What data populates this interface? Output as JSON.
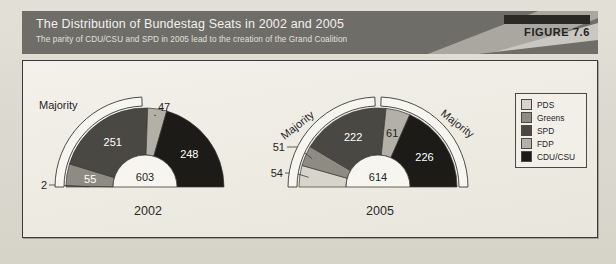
{
  "figure": {
    "title": "The Distribution of Bundestag Seats in 2002 and 2005",
    "subtitle": "The parity of CDU/CSU and SPD in 2005 lead to the creation of the Grand Coalition",
    "badge": "FIGURE 7.6"
  },
  "legend": {
    "position": "right",
    "items": [
      {
        "label": "PDS",
        "color": "#d7d4cb"
      },
      {
        "label": "Greens",
        "color": "#8e8b83"
      },
      {
        "label": "SPD",
        "color": "#4a4843"
      },
      {
        "label": "FDP",
        "color": "#b3b0a7"
      },
      {
        "label": "CDU/CSU",
        "color": "#1c1b18"
      }
    ]
  },
  "charts": [
    {
      "year": "2002",
      "total": "603",
      "majority_labels": [
        "Majority"
      ],
      "slices": [
        {
          "party": "PDS",
          "value": 2,
          "label": "2",
          "color": "#d7d4cb",
          "callout": true
        },
        {
          "party": "Greens",
          "value": 55,
          "label": "55",
          "color": "#8e8b83",
          "callout": false
        },
        {
          "party": "SPD",
          "value": 251,
          "label": "251",
          "color": "#4a4843",
          "callout": false
        },
        {
          "party": "FDP",
          "value": 47,
          "label": "47",
          "color": "#b3b0a7",
          "callout": true
        },
        {
          "party": "CDU/CSU",
          "value": 248,
          "label": "248",
          "color": "#1c1b18",
          "callout": false
        }
      ]
    },
    {
      "year": "2005",
      "total": "614",
      "majority_labels": [
        "Majority",
        "Majority"
      ],
      "slices": [
        {
          "party": "PDS",
          "value": 54,
          "label": "54",
          "color": "#d7d4cb",
          "callout": true
        },
        {
          "party": "Greens",
          "value": 51,
          "label": "51",
          "color": "#8e8b83",
          "callout": true
        },
        {
          "party": "SPD",
          "value": 222,
          "label": "222",
          "color": "#4a4843",
          "callout": false
        },
        {
          "party": "FDP",
          "value": 61,
          "label": "61",
          "color": "#b3b0a7",
          "callout": false
        },
        {
          "party": "CDU/CSU",
          "value": 226,
          "label": "226",
          "color": "#1c1b18",
          "callout": false
        }
      ]
    }
  ],
  "chart_data": {
    "type": "pie",
    "title": "The Distribution of Bundestag Seats in 2002 and 2005",
    "subtitle": "The parity of CDU/CSU and SPD in 2005 lead to the creation of the Grand Coalition",
    "variant": "half-donut (semicircle), two panels",
    "legend_entries": [
      "PDS",
      "Greens",
      "SPD",
      "FDP",
      "CDU/CSU"
    ],
    "legend_position": "right",
    "annotations": [
      "Majority",
      "Majority",
      "Majority"
    ],
    "panels": [
      {
        "name": "2002",
        "center_label": "603",
        "total": 603,
        "categories": [
          "PDS",
          "Greens",
          "SPD",
          "FDP",
          "CDU/CSU"
        ],
        "values": [
          2,
          55,
          251,
          47,
          248
        ]
      },
      {
        "name": "2005",
        "center_label": "614",
        "total": 614,
        "categories": [
          "PDS",
          "Greens",
          "SPD",
          "FDP",
          "CDU/CSU"
        ],
        "values": [
          54,
          51,
          222,
          61,
          226
        ]
      }
    ]
  }
}
